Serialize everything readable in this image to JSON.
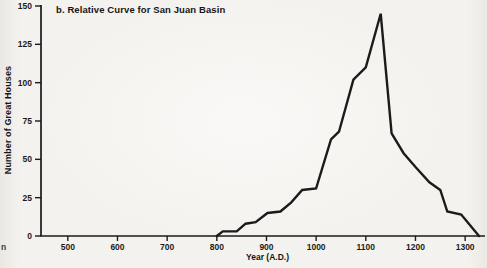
{
  "page": {
    "background_color": "#f4f2ee",
    "edge_fragment_text": "n"
  },
  "chart_data": {
    "type": "line",
    "title": "b. Relative Curve for San Juan Basin",
    "xlabel": "Year (A.D.)",
    "ylabel": "Number of Great Houses",
    "xlim": [
      446,
      1340
    ],
    "ylim": [
      0,
      150
    ],
    "x_ticks": [
      500,
      600,
      700,
      800,
      900,
      1000,
      1100,
      1200,
      1300
    ],
    "y_ticks": [
      0,
      25,
      50,
      75,
      100,
      125,
      150
    ],
    "grid": false,
    "legend_position": "none",
    "line_color": "#1b1b1b",
    "axis_color": "#1b1b1b",
    "series": [
      {
        "name": "Great Houses relative curve",
        "points": [
          [
            800,
            0
          ],
          [
            812,
            3
          ],
          [
            840,
            3
          ],
          [
            858,
            8
          ],
          [
            878,
            9
          ],
          [
            902,
            15
          ],
          [
            928,
            16
          ],
          [
            950,
            22
          ],
          [
            972,
            30
          ],
          [
            1000,
            31
          ],
          [
            1030,
            63
          ],
          [
            1046,
            68
          ],
          [
            1075,
            102
          ],
          [
            1100,
            110
          ],
          [
            1130,
            145
          ],
          [
            1152,
            67
          ],
          [
            1176,
            54
          ],
          [
            1200,
            45
          ],
          [
            1228,
            35
          ],
          [
            1250,
            30
          ],
          [
            1264,
            16
          ],
          [
            1292,
            14
          ],
          [
            1328,
            0
          ]
        ]
      }
    ]
  }
}
